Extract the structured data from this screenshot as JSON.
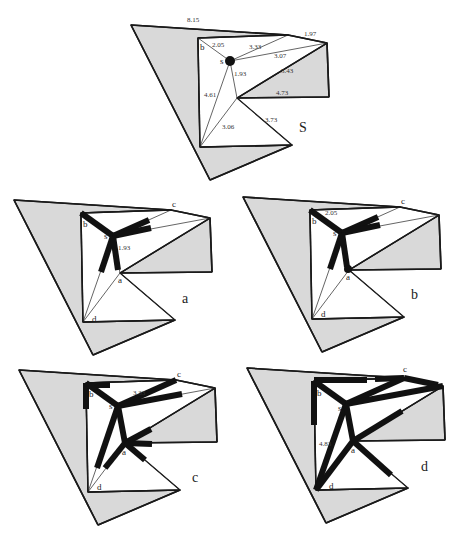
{
  "figure": {
    "panels": [
      {
        "id": "S",
        "caption": "S",
        "offset": [
          0,
          0
        ],
        "edge_labels": {
          "outer": "8.15",
          "top_right": "1.97",
          "s_b": "2.05",
          "s_c": "3.33",
          "s_r": "3.07",
          "a_r": "5.43",
          "a_box": "4.73",
          "s_a": "1.93",
          "s_d": "4.61",
          "a_d": "3.06",
          "a_e": "3.73"
        },
        "nodes": {
          "b": "b",
          "s": "s"
        }
      },
      {
        "id": "a",
        "caption": "a",
        "edge_label": "1.93",
        "nodes": {
          "b": "b",
          "c": "c",
          "s": "s",
          "a": "a",
          "d": "d"
        }
      },
      {
        "id": "b",
        "caption": "b",
        "edge_label": "2.05",
        "nodes": {
          "b": "b",
          "c": "c",
          "s": "s",
          "a": "a",
          "d": "d"
        }
      },
      {
        "id": "c",
        "caption": "c",
        "edge_label": "3.33",
        "nodes": {
          "b": "b",
          "c": "c",
          "s": "s",
          "a": "a",
          "d": "d"
        }
      },
      {
        "id": "d",
        "caption": "d",
        "edge_label": "4.83",
        "nodes": {
          "b": "b",
          "c": "c",
          "s": "s",
          "a": "a",
          "d": "d"
        }
      }
    ]
  },
  "colors": {
    "obstacle_fill": "#d9d9d9",
    "edge": "#1a1a1a",
    "background": "#ffffff"
  }
}
